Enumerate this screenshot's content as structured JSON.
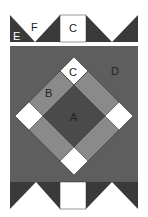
{
  "diagram": {
    "labels": {
      "A": "A",
      "B": "B",
      "C_top": "C",
      "C_middle": "C",
      "D": "D",
      "E": "E",
      "F": "F"
    },
    "colors": {
      "dark": "#3a3a3a",
      "medium_dark": "#5e5e5e",
      "medium": "#8a8a8a",
      "white": "#ffffff",
      "center": "#4a4a4a"
    }
  }
}
